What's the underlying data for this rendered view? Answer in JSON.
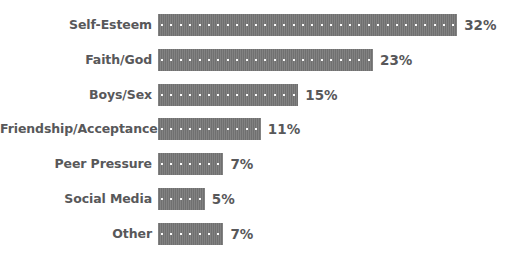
{
  "chart_data": {
    "type": "bar",
    "orientation": "horizontal",
    "title": "",
    "subtitle": "",
    "xlabel": "",
    "ylabel": "",
    "grid": false,
    "legend": false,
    "legend_position": "none",
    "axis_visible": false,
    "xlim": [
      0,
      32
    ],
    "categories": [
      "Self-Esteem",
      "Faith/God",
      "Boys/Sex",
      "Friendship/Acceptance",
      "Peer Pressure",
      "Social Media",
      "Other"
    ],
    "values": [
      32,
      23,
      15,
      11,
      7,
      5,
      7
    ],
    "value_labels": [
      "32%",
      "23%",
      "15%",
      "11%",
      "7%",
      "5%",
      "7%"
    ],
    "bar_color": "#767676",
    "label_color": "#58585a",
    "background_color": "#ffffff",
    "pattern": "dotted"
  },
  "bars": [
    {
      "label": "Self-Esteem",
      "value": 32,
      "value_label": "32%"
    },
    {
      "label": "Faith/God",
      "value": 23,
      "value_label": "23%"
    },
    {
      "label": "Boys/Sex",
      "value": 15,
      "value_label": "15%"
    },
    {
      "label": "Friendship/Acceptance",
      "value": 11,
      "value_label": "11%"
    },
    {
      "label": "Peer Pressure",
      "value": 7,
      "value_label": "7%"
    },
    {
      "label": "Social Media",
      "value": 5,
      "value_label": "5%"
    },
    {
      "label": "Other",
      "value": 7,
      "value_label": "7%"
    }
  ]
}
